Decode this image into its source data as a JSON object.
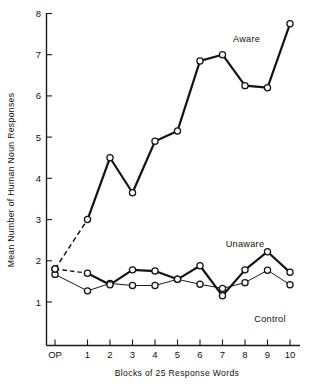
{
  "chart_data": {
    "type": "line",
    "title": "",
    "xlabel": "Blocks of 25 Response Words",
    "ylabel": "Mean Number of Human Noun Responses",
    "categories": [
      "OP",
      "1",
      "2",
      "3",
      "4",
      "5",
      "6",
      "7",
      "8",
      "9",
      "10"
    ],
    "xtick_labels": [
      "OP",
      "1",
      "2",
      "3",
      "4",
      "5",
      "6",
      "7",
      "8",
      "9",
      "10"
    ],
    "ytick_labels": [
      "1",
      "2",
      "3",
      "4",
      "5",
      "6",
      "7",
      "8"
    ],
    "ylim": [
      0.45,
      8.0
    ],
    "xlim": [
      "OP",
      "10"
    ],
    "grid": false,
    "legend_position": "inline-annotations",
    "series": [
      {
        "name": "Aware",
        "label": "Aware",
        "style": "thick-solid-with-dashed-baseline-segment",
        "values": [
          1.8,
          3.0,
          4.5,
          3.65,
          4.9,
          5.15,
          6.85,
          7.0,
          6.25,
          6.2,
          7.75
        ]
      },
      {
        "name": "Unaware",
        "label": "Unaware",
        "style": "thick-solid-with-dashed-baseline-segment",
        "values": [
          1.8,
          1.7,
          1.42,
          1.78,
          1.75,
          1.55,
          1.88,
          1.15,
          1.78,
          2.22,
          1.72
        ]
      },
      {
        "name": "Control",
        "label": "Control",
        "style": "thin-solid",
        "values": [
          1.67,
          1.27,
          1.45,
          1.4,
          1.4,
          1.55,
          1.43,
          1.33,
          1.47,
          1.77,
          1.42
        ]
      }
    ],
    "annotations": [
      {
        "text": "Aware",
        "series": "Aware"
      },
      {
        "text": "Unaware",
        "series": "Unaware"
      },
      {
        "text": "Control",
        "series": "Control"
      }
    ]
  },
  "colors": {
    "ink": "#141414",
    "background": "#ffffff"
  }
}
